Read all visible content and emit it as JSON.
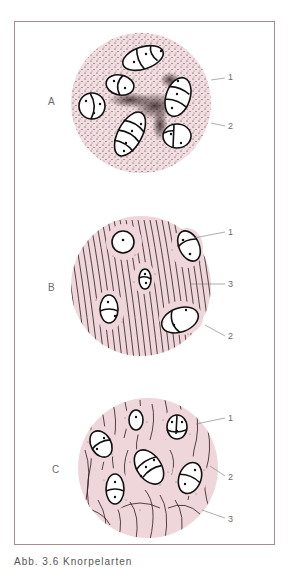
{
  "figure": {
    "panels": [
      {
        "label": "A",
        "description": "Hyaline cartilage: chondrocyte isogenous groups in finely stippled matrix",
        "callouts": [
          "1",
          "2"
        ],
        "matrix": "stippled",
        "fill_color": "#f2dde0"
      },
      {
        "label": "B",
        "description": "Fibrocartilage: chondrocytes among parallel collagen fibers",
        "callouts": [
          "1",
          "3",
          "2"
        ],
        "matrix": "parallel-fibers",
        "fill_color": "#efd6da"
      },
      {
        "label": "C",
        "description": "Elastic cartilage: chondrocytes among branching elastic fibers",
        "callouts": [
          "1",
          "2",
          "3"
        ],
        "matrix": "branching-fibers",
        "fill_color": "#efd6da"
      }
    ],
    "caption": "Abb. 3.6 Knorpelarten",
    "colors": {
      "frame": "#a98a8e",
      "ink": "#1a1a1a",
      "label": "#6a6a6a"
    }
  }
}
